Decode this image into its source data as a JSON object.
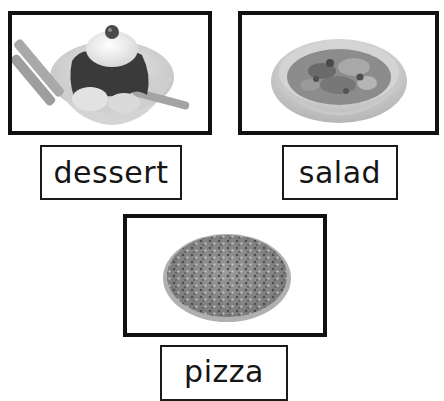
{
  "cards": [
    {
      "id": "dessert",
      "label": "dessert",
      "image": "ice-cream-sundae-image"
    },
    {
      "id": "salad",
      "label": "salad",
      "image": "salad-bowl-image"
    },
    {
      "id": "pizza",
      "label": "pizza",
      "image": "pizza-image"
    }
  ],
  "colors": {
    "border": "#111111",
    "text": "#151515",
    "background": "#ffffff"
  }
}
